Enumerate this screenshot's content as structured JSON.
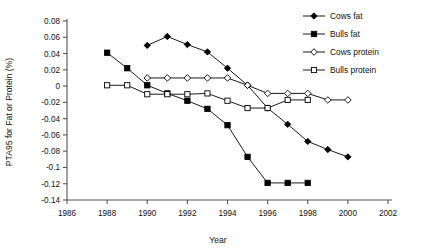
{
  "chart_data": {
    "type": "line",
    "title": "",
    "xlabel": "Year",
    "ylabel": "PTA95 for Fat or Protein (%)",
    "xlim": [
      1986,
      2002
    ],
    "ylim": [
      -0.14,
      0.08
    ],
    "xticks": [
      "1986",
      "1988",
      "1990",
      "1992",
      "1994",
      "1996",
      "1998",
      "2000",
      "2002"
    ],
    "xtick_values": [
      1986,
      1988,
      1990,
      1992,
      1994,
      1996,
      1998,
      2000,
      2002
    ],
    "yticks": [
      "0.08",
      "0.06",
      "0.04",
      "0.02",
      "0",
      "-0.02",
      "-0.04",
      "-0.06",
      "-0.08",
      "-0.1",
      "-0.12",
      "-0.14"
    ],
    "ytick_values": [
      0.08,
      0.06,
      0.04,
      0.02,
      0,
      -0.02,
      -0.04,
      -0.06,
      -0.08,
      -0.1,
      -0.12,
      -0.14
    ],
    "grid": false,
    "legend_position": "top-right",
    "series": [
      {
        "name": "Cows fat",
        "marker": "filled-diamond",
        "x": [
          1990,
          1991,
          1992,
          1993,
          1994,
          1995,
          1996,
          1997,
          1998,
          1999,
          2000
        ],
        "values": [
          0.05,
          0.061,
          0.051,
          0.042,
          0.022,
          0.001,
          -0.027,
          -0.047,
          -0.068,
          -0.078,
          -0.087
        ]
      },
      {
        "name": "Bulls fat",
        "marker": "filled-square",
        "x": [
          1988,
          1989,
          1990,
          1991,
          1992,
          1993,
          1994,
          1995,
          1996,
          1997,
          1998
        ],
        "values": [
          0.041,
          0.022,
          0.001,
          -0.009,
          -0.018,
          -0.028,
          -0.048,
          -0.087,
          -0.119,
          -0.119,
          -0.119
        ]
      },
      {
        "name": "Cows protein",
        "marker": "open-diamond",
        "x": [
          1990,
          1991,
          1992,
          1993,
          1994,
          1995,
          1996,
          1997,
          1998,
          1999,
          2000
        ],
        "values": [
          0.01,
          0.01,
          0.01,
          0.01,
          0.01,
          0.001,
          -0.009,
          -0.009,
          -0.009,
          -0.017,
          -0.017
        ]
      },
      {
        "name": "Bulls protein",
        "marker": "open-square",
        "x": [
          1988,
          1989,
          1990,
          1991,
          1992,
          1993,
          1994,
          1995,
          1996,
          1997,
          1998
        ],
        "values": [
          0.001,
          0.001,
          -0.01,
          -0.01,
          -0.01,
          -0.009,
          -0.018,
          -0.027,
          -0.027,
          -0.017,
          -0.017
        ]
      }
    ]
  }
}
